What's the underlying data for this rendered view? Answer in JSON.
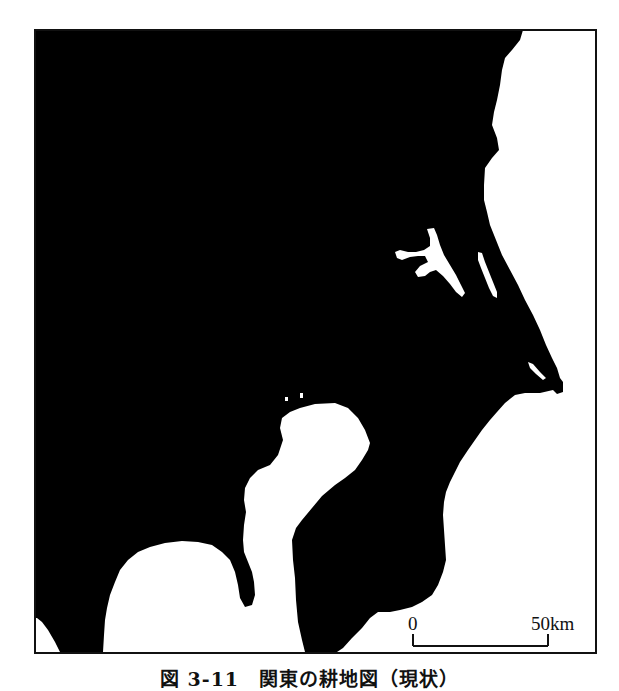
{
  "figure": {
    "caption": "図 3-11　関東の耕地図（現状）",
    "colors": {
      "land_mask": "#000000",
      "background": "#ffffff",
      "frame": "#111111"
    },
    "legend_semantics": {
      "black": "masked area",
      "white": "water / urban / non-masked area"
    }
  },
  "scale_bar": {
    "start_label": "0",
    "end_label": "50",
    "unit": "km",
    "end_text": "50km"
  },
  "features": [
    {
      "name": "pacific-ocean",
      "type": "water"
    },
    {
      "name": "lake-kasumigaura",
      "type": "water"
    },
    {
      "name": "lake-kitaura",
      "type": "water"
    },
    {
      "name": "tokyo-urban-area",
      "type": "urban"
    },
    {
      "name": "tokyo-bay",
      "type": "water"
    },
    {
      "name": "sagami-bay",
      "type": "water"
    },
    {
      "name": "boso-peninsula",
      "type": "land"
    },
    {
      "name": "miura-peninsula",
      "type": "land"
    },
    {
      "name": "cape-inubo",
      "type": "landmark"
    }
  ]
}
